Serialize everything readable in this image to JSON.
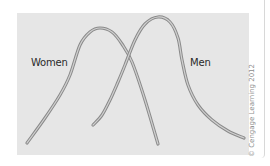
{
  "chart_data": {
    "type": "line",
    "title": "",
    "xlabel": "",
    "ylabel": "",
    "grid": false,
    "legend": "inline labels",
    "axes_visible": false,
    "series": [
      {
        "name": "Women",
        "label_position": "left of peak",
        "shape": "bell curve, peak left of center",
        "points_px": [
          [
            27,
            143
          ],
          [
            45,
            118
          ],
          [
            60,
            95
          ],
          [
            70,
            75
          ],
          [
            80,
            45
          ],
          [
            90,
            32
          ],
          [
            100,
            28
          ],
          [
            112,
            32
          ],
          [
            122,
            44
          ],
          [
            132,
            62
          ],
          [
            145,
            100
          ],
          [
            158,
            144
          ]
        ]
      },
      {
        "name": "Men",
        "label_position": "right of peak",
        "shape": "bell curve, peak right of center, long right tail",
        "points_px": [
          [
            93,
            125
          ],
          [
            102,
            115
          ],
          [
            110,
            100
          ],
          [
            118,
            82
          ],
          [
            125,
            65
          ],
          [
            135,
            40
          ],
          [
            145,
            24
          ],
          [
            158,
            17
          ],
          [
            170,
            22
          ],
          [
            178,
            38
          ],
          [
            182,
            60
          ],
          [
            188,
            85
          ],
          [
            198,
            105
          ],
          [
            212,
            120
          ],
          [
            228,
            131
          ],
          [
            244,
            138
          ]
        ]
      }
    ],
    "crossing_point_px": [
      128,
      55
    ],
    "colors": {
      "background": "#e6e6e6",
      "line_outer": "#8a8a8a",
      "line_inner": "#d0d0d0",
      "text": "#2a2a2a"
    }
  },
  "labels": {
    "women": "Women",
    "men": "Men"
  },
  "credit": "© Cengage Learning 2012"
}
